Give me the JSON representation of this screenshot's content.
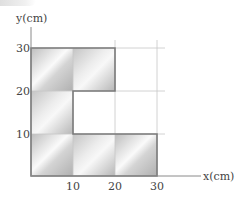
{
  "figure": {
    "type": "geometry-diagram",
    "x_axis": {
      "label": "x(cm)",
      "ticks": [
        "10",
        "20",
        "30"
      ]
    },
    "y_axis": {
      "label": "y(cm)",
      "ticks": [
        "10",
        "20",
        "30"
      ]
    },
    "grid_spacing_cm": 10,
    "shape_vertices_cm": [
      [
        0,
        0
      ],
      [
        30,
        0
      ],
      [
        30,
        10
      ],
      [
        10,
        10
      ],
      [
        10,
        20
      ],
      [
        20,
        20
      ],
      [
        20,
        30
      ],
      [
        0,
        30
      ]
    ],
    "colors": {
      "shape_fill_dark": "#b8b8b8",
      "shape_fill_light": "#f4f4f4",
      "shape_edge": "#7a7a7a",
      "grid": "#c8c8c8",
      "axis": "#8a8a8a",
      "text": "#444444"
    }
  }
}
